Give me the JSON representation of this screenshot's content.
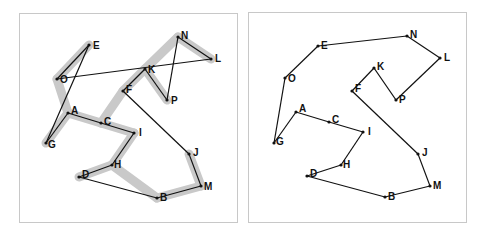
{
  "figure": {
    "colors": {
      "edge": "#111111",
      "highlight": "#c9c9c9",
      "node": "#111111",
      "border": "#c8c8c8"
    },
    "left_panel": {
      "nodes": [
        {
          "id": "E",
          "x": 89,
          "y": 45,
          "lx": 4,
          "ly": 4
        },
        {
          "id": "O",
          "x": 57,
          "y": 79,
          "lx": 3,
          "ly": 4
        },
        {
          "id": "N",
          "x": 178,
          "y": 37,
          "lx": 3,
          "ly": 2
        },
        {
          "id": "L",
          "x": 211,
          "y": 59,
          "lx": 4,
          "ly": 3
        },
        {
          "id": "K",
          "x": 145,
          "y": 69,
          "lx": 3,
          "ly": 4
        },
        {
          "id": "F",
          "x": 123,
          "y": 91,
          "lx": 3,
          "ly": 2
        },
        {
          "id": "P",
          "x": 167,
          "y": 100,
          "lx": 4,
          "ly": 4
        },
        {
          "id": "A",
          "x": 68,
          "y": 113,
          "lx": 3,
          "ly": 1
        },
        {
          "id": "C",
          "x": 101,
          "y": 123,
          "lx": 3,
          "ly": 2
        },
        {
          "id": "I",
          "x": 134,
          "y": 133,
          "lx": 5,
          "ly": 3
        },
        {
          "id": "G",
          "x": 46,
          "y": 143,
          "lx": 2,
          "ly": 5
        },
        {
          "id": "J",
          "x": 189,
          "y": 154,
          "lx": 4,
          "ly": 2
        },
        {
          "id": "H",
          "x": 112,
          "y": 165,
          "lx": 2,
          "ly": 3
        },
        {
          "id": "D",
          "x": 79,
          "y": 177,
          "lx": 3,
          "ly": 1
        },
        {
          "id": "M",
          "x": 201,
          "y": 186,
          "lx": 3,
          "ly": 4
        },
        {
          "id": "B",
          "x": 157,
          "y": 198,
          "lx": 3,
          "ly": 3
        }
      ],
      "edges": [
        [
          "E",
          "O"
        ],
        [
          "E",
          "G"
        ],
        [
          "O",
          "L"
        ],
        [
          "G",
          "A"
        ],
        [
          "A",
          "C"
        ],
        [
          "C",
          "I"
        ],
        [
          "I",
          "H"
        ],
        [
          "H",
          "D"
        ],
        [
          "D",
          "B"
        ],
        [
          "B",
          "M"
        ],
        [
          "M",
          "J"
        ],
        [
          "J",
          "F"
        ],
        [
          "F",
          "K"
        ],
        [
          "K",
          "P"
        ],
        [
          "P",
          "N"
        ],
        [
          "N",
          "L"
        ]
      ],
      "highlight_edges": [
        [
          "E",
          "O"
        ],
        [
          "O",
          "A"
        ],
        [
          "A",
          "G"
        ],
        [
          "A",
          "C"
        ],
        [
          "C",
          "I"
        ],
        [
          "I",
          "H"
        ],
        [
          "H",
          "D"
        ],
        [
          "H",
          "B"
        ],
        [
          "B",
          "M"
        ],
        [
          "M",
          "J"
        ],
        [
          "C",
          "F"
        ],
        [
          "F",
          "K"
        ],
        [
          "K",
          "N"
        ],
        [
          "N",
          "L"
        ],
        [
          "K",
          "P"
        ]
      ]
    },
    "right_panel": {
      "nodes": [
        {
          "id": "E",
          "x": 318,
          "y": 46,
          "lx": 3,
          "ly": 3
        },
        {
          "id": "N",
          "x": 407,
          "y": 36,
          "lx": 3,
          "ly": 2
        },
        {
          "id": "L",
          "x": 440,
          "y": 58,
          "lx": 4,
          "ly": 3
        },
        {
          "id": "O",
          "x": 285,
          "y": 78,
          "lx": 3,
          "ly": 4
        },
        {
          "id": "K",
          "x": 374,
          "y": 68,
          "lx": 3,
          "ly": 2
        },
        {
          "id": "F",
          "x": 352,
          "y": 91,
          "lx": 3,
          "ly": 1
        },
        {
          "id": "P",
          "x": 396,
          "y": 100,
          "lx": 3,
          "ly": 3
        },
        {
          "id": "A",
          "x": 296,
          "y": 112,
          "lx": 3,
          "ly": 0
        },
        {
          "id": "C",
          "x": 329,
          "y": 122,
          "lx": 3,
          "ly": 1
        },
        {
          "id": "I",
          "x": 363,
          "y": 132,
          "lx": 5,
          "ly": 3
        },
        {
          "id": "G",
          "x": 274,
          "y": 143,
          "lx": 2,
          "ly": 2
        },
        {
          "id": "J",
          "x": 418,
          "y": 154,
          "lx": 4,
          "ly": 2
        },
        {
          "id": "H",
          "x": 341,
          "y": 165,
          "lx": 2,
          "ly": 3
        },
        {
          "id": "D",
          "x": 307,
          "y": 176,
          "lx": 3,
          "ly": 1
        },
        {
          "id": "M",
          "x": 430,
          "y": 186,
          "lx": 3,
          "ly": 3
        },
        {
          "id": "B",
          "x": 385,
          "y": 197,
          "lx": 3,
          "ly": 3
        }
      ],
      "edges": [
        [
          "E",
          "N"
        ],
        [
          "N",
          "L"
        ],
        [
          "L",
          "P"
        ],
        [
          "P",
          "K"
        ],
        [
          "K",
          "F"
        ],
        [
          "F",
          "J"
        ],
        [
          "J",
          "M"
        ],
        [
          "M",
          "B"
        ],
        [
          "B",
          "D"
        ],
        [
          "D",
          "H"
        ],
        [
          "H",
          "I"
        ],
        [
          "I",
          "C"
        ],
        [
          "C",
          "A"
        ],
        [
          "A",
          "G"
        ],
        [
          "G",
          "O"
        ],
        [
          "O",
          "E"
        ]
      ]
    }
  }
}
